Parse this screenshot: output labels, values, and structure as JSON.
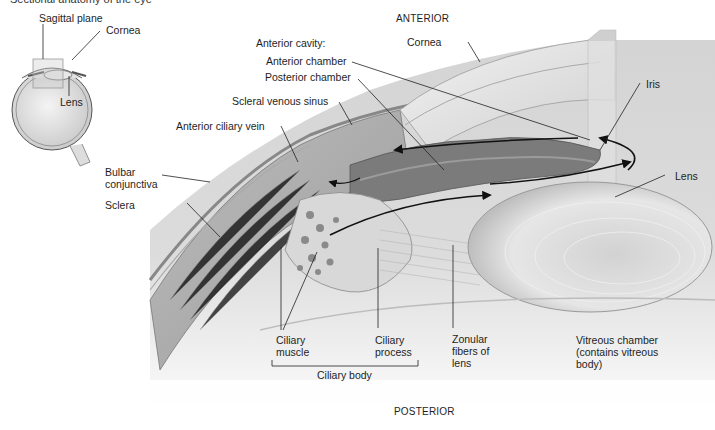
{
  "figure": {
    "cropped_title_fragment": "Sectional anatomy of the eye",
    "orientation": {
      "top": "ANTERIOR",
      "bottom": "POSTERIOR"
    },
    "inset": {
      "labels": {
        "sagittal_plane": "Sagittal plane",
        "cornea": "Cornea",
        "lens": "Lens"
      }
    },
    "labels": {
      "anterior_cavity": "Anterior cavity:",
      "anterior_chamber": "Anterior chamber",
      "posterior_chamber": "Posterior chamber",
      "scleral_venous_sinus": "Scleral venous sinus",
      "anterior_ciliary_vein": "Anterior ciliary vein",
      "bulbar_conjunctiva": "Bulbar conjunctiva",
      "sclera": "Sclera",
      "cornea": "Cornea",
      "iris": "Iris",
      "lens": "Lens",
      "ciliary_muscle": "Ciliary muscle",
      "ciliary_process": "Ciliary process",
      "ciliary_body": "Ciliary body",
      "zonular_fibers": "Zonular fibers of lens",
      "vitreous_chamber": "Vitreous chamber (contains vitreous body)"
    },
    "colors": {
      "background": "#ffffff",
      "tissue_dark": "#6e6e6e",
      "tissue_mid": "#a9a9a9",
      "tissue_light": "#d8d8d8",
      "leader_line": "#222222"
    }
  }
}
